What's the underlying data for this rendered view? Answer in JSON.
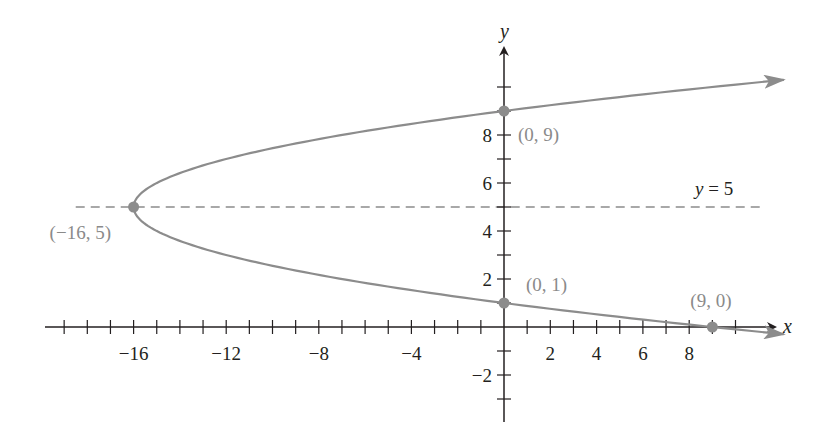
{
  "chart_data": {
    "type": "line",
    "title": "",
    "xlabel": "x",
    "ylabel": "y",
    "xlim": [
      -19,
      10
    ],
    "ylim": [
      -3,
      10
    ],
    "x_ticks": [
      -19,
      -18,
      -17,
      -16,
      -15,
      -14,
      -13,
      -12,
      -11,
      -10,
      -9,
      -8,
      -7,
      -6,
      -5,
      -4,
      -3,
      -2,
      -1,
      1,
      2,
      3,
      4,
      5,
      6,
      7,
      8,
      9,
      10
    ],
    "x_tick_labels": [
      {
        "value": -16,
        "label": "−16"
      },
      {
        "value": -12,
        "label": "−12"
      },
      {
        "value": -8,
        "label": "−8"
      },
      {
        "value": -4,
        "label": "−4"
      },
      {
        "value": 2,
        "label": "2"
      },
      {
        "value": 4,
        "label": "4"
      },
      {
        "value": 6,
        "label": "6"
      },
      {
        "value": 8,
        "label": "8"
      }
    ],
    "y_ticks": [
      -3,
      -2,
      -1,
      1,
      2,
      3,
      4,
      5,
      6,
      7,
      8,
      9,
      10
    ],
    "y_tick_labels": [
      {
        "value": -2,
        "label": "−2"
      },
      {
        "value": 2,
        "label": "2"
      },
      {
        "value": 4,
        "label": "4"
      },
      {
        "value": 6,
        "label": "6"
      },
      {
        "value": 8,
        "label": "8"
      }
    ],
    "grid": false,
    "series": [
      {
        "name": "parabola",
        "equation": "x = (y − 5)² − 16",
        "y_range": [
          -0.3,
          10.3
        ],
        "color": "#8c8c8c"
      }
    ],
    "asymptote_line": {
      "name": "axis of symmetry",
      "y": 5,
      "label": "y = 5",
      "x_range": [
        -18.5,
        11.3
      ],
      "color": "#8c8c8c"
    },
    "points": [
      {
        "x": -16,
        "y": 5,
        "label": "(−16, 5)"
      },
      {
        "x": 0,
        "y": 9,
        "label": "(0, 9)"
      },
      {
        "x": 0,
        "y": 1,
        "label": "(0, 1)"
      },
      {
        "x": 9,
        "y": 0,
        "label": "(9, 0)"
      }
    ],
    "colors": {
      "axis": "#231f20",
      "curve": "#8c8c8c",
      "point": "#8c8c8c",
      "point_label": "#8a8a8a"
    }
  }
}
